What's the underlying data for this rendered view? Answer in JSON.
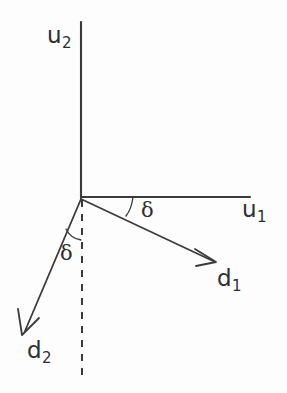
{
  "figure": {
    "background_color": "#fdfdfd",
    "ink_color": "#3b3b3d",
    "origin": {
      "x": 81,
      "y": 198
    },
    "axes": [
      {
        "name": "u2",
        "label": "u",
        "subscript": "2",
        "orientation": "vertical",
        "from": {
          "x": 81,
          "y": 198
        },
        "to": {
          "x": 81,
          "y": 22
        }
      },
      {
        "name": "u1",
        "label": "u",
        "subscript": "1",
        "orientation": "horizontal",
        "from": {
          "x": 81,
          "y": 197
        },
        "to": {
          "x": 250,
          "y": 197
        }
      }
    ],
    "vectors": [
      {
        "name": "d1",
        "label": "d",
        "subscript": "1",
        "from": {
          "x": 81,
          "y": 198
        },
        "to": {
          "x": 216,
          "y": 262
        },
        "angle_from_u1_axis_deg": 25,
        "arrowhead": true
      },
      {
        "name": "d2",
        "label": "d",
        "subscript": "2",
        "from": {
          "x": 81,
          "y": 198
        },
        "to": {
          "x": 22,
          "y": 335
        },
        "angle_from_negative_u2_axis_deg": 23,
        "arrowhead": true
      }
    ],
    "reference_line": {
      "name": "negative-u2-dashed",
      "style": "dashed",
      "from": {
        "x": 82,
        "y": 200
      },
      "to": {
        "x": 82,
        "y": 380
      }
    },
    "angle_marks": [
      {
        "name": "delta-between-u1-and-d1",
        "symbol": "δ",
        "arc_center": {
          "x": 81,
          "y": 198
        },
        "arc_radius": 52,
        "between": [
          "u1",
          "d1"
        ]
      },
      {
        "name": "delta-between-dashed-and-d2",
        "symbol": "δ",
        "arc_center": {
          "x": 81,
          "y": 198
        },
        "arc_radius": 42,
        "between": [
          "negative-u2-dashed",
          "d2"
        ]
      }
    ]
  }
}
